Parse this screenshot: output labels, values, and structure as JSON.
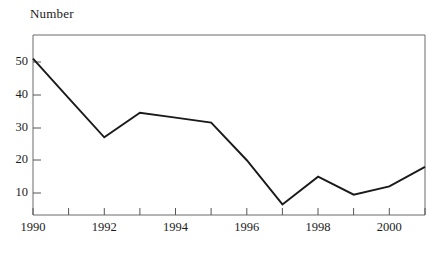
{
  "chart_data": {
    "type": "line",
    "title": "",
    "ylabel": "Number",
    "xlabel": "",
    "grid": false,
    "legend": "none",
    "xlim": [
      1990,
      2001
    ],
    "ylim": [
      0,
      56
    ],
    "x": [
      1990,
      1991,
      1992,
      1993,
      1994,
      1995,
      1996,
      1997,
      1998,
      1999,
      2000,
      2001
    ],
    "values": [
      51,
      39,
      27,
      34.5,
      33,
      31.5,
      20,
      6.5,
      15,
      9.5,
      12,
      18
    ],
    "series": [
      {
        "name": "Number",
        "values": [
          51,
          39,
          27,
          34.5,
          33,
          31.5,
          20,
          6.5,
          15,
          9.5,
          12,
          18
        ]
      }
    ],
    "y_ticks": [
      10,
      20,
      30,
      40,
      50
    ],
    "y_tick_labels": [
      "10",
      "20",
      "30",
      "40",
      "50"
    ],
    "x_ticks": [
      1990,
      1991,
      1992,
      1993,
      1994,
      1995,
      1996,
      1997,
      1998,
      1999,
      2000,
      2001
    ],
    "x_tick_labels": [
      "1990",
      "",
      "1992",
      "",
      "1994",
      "",
      "1996",
      "",
      "1998",
      "",
      "2000",
      ""
    ],
    "line_color": "#1a1a1a",
    "axis_color": "#555555"
  },
  "axis_title": "Number",
  "y_labels": {
    "t50": "50",
    "t40": "40",
    "t30": "30",
    "t20": "20",
    "t10": "10"
  },
  "x_labels": {
    "y1990": "1990",
    "y1992": "1992",
    "y1994": "1994",
    "y1996": "1996",
    "y1998": "1998",
    "y2000": "2000"
  }
}
